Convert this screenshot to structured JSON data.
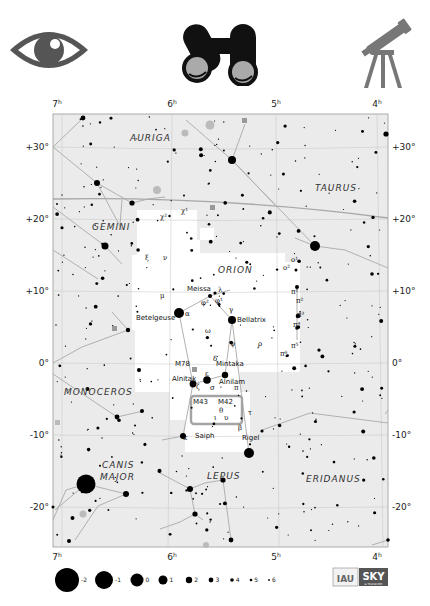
{
  "header": {
    "icons": [
      {
        "name": "naked-eye-icon",
        "label": "Naked eye"
      },
      {
        "name": "binoculars-icon",
        "label": "Binoculars"
      },
      {
        "name": "telescope-icon",
        "label": "Telescope"
      }
    ]
  },
  "chart": {
    "frame": {
      "x": 53,
      "y": 114,
      "w": 335,
      "h": 433
    },
    "colors": {
      "sky": "#ebebeb",
      "highlight": "#ffffff",
      "lines": "#9a9a9a",
      "grid": "#bdbdbd",
      "star": "#000000",
      "galaxy": "#aaaaaa",
      "box": "#a0a0a0"
    },
    "ra_ticks": [
      {
        "label": "7",
        "sup": "h",
        "x": 57
      },
      {
        "label": "6",
        "sup": "h",
        "x": 172
      },
      {
        "label": "5",
        "sup": "h",
        "x": 276
      },
      {
        "label": "4",
        "sup": "h",
        "x": 377
      }
    ],
    "dec_ticks": [
      {
        "label": "+30°",
        "y": 147
      },
      {
        "label": "+20°",
        "y": 219
      },
      {
        "label": "+10°",
        "y": 291
      },
      {
        "label": "0°",
        "y": 363
      },
      {
        "label": "-10°",
        "y": 435
      },
      {
        "label": "-20°",
        "y": 507
      }
    ],
    "constellations": [
      {
        "name": "AURIGA",
        "x": 130,
        "y": 141
      },
      {
        "name": "TAURUS",
        "x": 315,
        "y": 191
      },
      {
        "name": "GEMINI",
        "x": 92,
        "y": 230
      },
      {
        "name": "ORION",
        "x": 218,
        "y": 273
      },
      {
        "name": "MONOCEROS",
        "x": 64,
        "y": 395
      },
      {
        "name": "CANIS",
        "x": 102,
        "y": 468
      },
      {
        "name": "MAJOR",
        "x": 100,
        "y": 480
      },
      {
        "name": "LEPUS",
        "x": 207,
        "y": 479
      },
      {
        "name": "ERIDANUS",
        "x": 306,
        "y": 482
      }
    ],
    "star_labels": [
      {
        "text": "Meissa",
        "x": 187,
        "y": 291
      },
      {
        "text": "Betelgeuse",
        "x": 136,
        "y": 320
      },
      {
        "text": "Bellatrix",
        "x": 237,
        "y": 322
      },
      {
        "text": "M78",
        "x": 175,
        "y": 366
      },
      {
        "text": "Mintaka",
        "x": 216,
        "y": 366
      },
      {
        "text": "Alnitak",
        "x": 172,
        "y": 381
      },
      {
        "text": "Alnilam",
        "x": 219,
        "y": 384
      },
      {
        "text": "M43",
        "x": 193,
        "y": 404
      },
      {
        "text": "M42",
        "x": 218,
        "y": 404
      },
      {
        "text": "Saiph",
        "x": 195,
        "y": 438
      },
      {
        "text": "Rigel",
        "x": 242,
        "y": 440
      }
    ],
    "greek_labels": [
      {
        "text": "χ²",
        "x": 160,
        "y": 219
      },
      {
        "text": "χ¹",
        "x": 181,
        "y": 213
      },
      {
        "text": "ξ",
        "x": 145,
        "y": 260
      },
      {
        "text": "ν",
        "x": 163,
        "y": 260
      },
      {
        "text": "μ",
        "x": 160,
        "y": 298
      },
      {
        "text": "λ",
        "x": 218,
        "y": 292
      },
      {
        "text": "φ²",
        "x": 201,
        "y": 305
      },
      {
        "text": "φ¹",
        "x": 215,
        "y": 303
      },
      {
        "text": "α",
        "x": 185,
        "y": 316
      },
      {
        "text": "γ",
        "x": 229,
        "y": 312
      },
      {
        "text": "ω",
        "x": 205,
        "y": 333
      },
      {
        "text": "ψ",
        "x": 230,
        "y": 346
      },
      {
        "text": "ρ",
        "x": 258,
        "y": 346
      },
      {
        "text": "δ",
        "x": 213,
        "y": 361
      },
      {
        "text": "ε",
        "x": 205,
        "y": 376
      },
      {
        "text": "ζ",
        "x": 196,
        "y": 389
      },
      {
        "text": "σ",
        "x": 210,
        "y": 390
      },
      {
        "text": "π",
        "x": 234,
        "y": 390
      },
      {
        "text": "θ",
        "x": 219,
        "y": 413
      },
      {
        "text": "ι",
        "x": 214,
        "y": 420
      },
      {
        "text": "υ",
        "x": 224,
        "y": 420
      },
      {
        "text": "τ",
        "x": 248,
        "y": 415
      },
      {
        "text": "β",
        "x": 238,
        "y": 430
      },
      {
        "text": "κ",
        "x": 183,
        "y": 440
      },
      {
        "text": "ο²",
        "x": 283,
        "y": 270
      },
      {
        "text": "ο¹",
        "x": 291,
        "y": 262
      },
      {
        "text": "π¹",
        "x": 291,
        "y": 294
      },
      {
        "text": "π²",
        "x": 296,
        "y": 303
      },
      {
        "text": "π³",
        "x": 297,
        "y": 317
      },
      {
        "text": "π⁴",
        "x": 293,
        "y": 327
      },
      {
        "text": "π⁵",
        "x": 291,
        "y": 348
      },
      {
        "text": "π⁶",
        "x": 280,
        "y": 356
      }
    ],
    "legend": {
      "magnitudes": [
        {
          "label": "-2",
          "x": 67,
          "r": 12
        },
        {
          "label": "-1",
          "x": 104,
          "r": 9
        },
        {
          "label": "0",
          "x": 137,
          "r": 6.5
        },
        {
          "label": "1",
          "x": 163,
          "r": 4.5
        },
        {
          "label": "2",
          "x": 189,
          "r": 3.2
        },
        {
          "label": "3",
          "x": 211,
          "r": 2.4
        },
        {
          "label": "4",
          "x": 232,
          "r": 1.8
        },
        {
          "label": "5",
          "x": 251,
          "r": 1.3
        },
        {
          "label": "6",
          "x": 269,
          "r": 0.9
        }
      ],
      "y": 580
    },
    "logos": {
      "iau": "IAU",
      "sky": "SKY",
      "sky_sub": "& TELESCOPE"
    }
  }
}
